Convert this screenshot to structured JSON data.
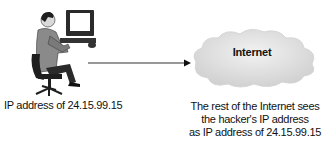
{
  "diagram": {
    "nodes": {
      "hacker": {
        "icon": "person-at-computer-icon",
        "caption": "IP address of 24.15.99.15"
      },
      "internet": {
        "icon": "cloud-icon",
        "label": "Internet",
        "caption_lines": [
          "The rest of the Internet sees",
          "the hacker's IP address",
          "as IP address of 24.15.99.15"
        ]
      }
    },
    "edges": [
      {
        "from": "hacker",
        "to": "internet",
        "style": "arrow"
      }
    ]
  },
  "colors": {
    "line": "#333333",
    "cloud_fill": "#e6e6e6",
    "cloud_shade": "#cfcfcf",
    "suit": "#8a8a8a",
    "hair": "#1e1e1e"
  }
}
